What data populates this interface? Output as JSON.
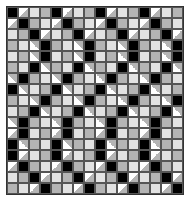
{
  "grid": {
    "columns": 16,
    "rows": 17,
    "cell_size_px": 11,
    "repeat_columns": 4,
    "colors": {
      "black": "#000000",
      "light": "#e2e2e2",
      "gray": "#b4b4b4",
      "white": "#ffffff",
      "border": "#555555"
    },
    "legend": {
      "B": "black square",
      "L": "light gray square",
      "G": "mid gray square",
      "TB": "half-square triangle (white/gray, diagonal /)",
      "TF": "half-square triangle (white/gray, diagonal \\)"
    },
    "unit_rows": [
      [
        "B",
        "TF",
        "L",
        "G"
      ],
      [
        "TF",
        "B",
        "G",
        "L"
      ],
      [
        "L",
        "G",
        "B",
        "TF"
      ],
      [
        "G",
        "L",
        "TB",
        "B"
      ],
      [
        "L",
        "G",
        "TB",
        "B"
      ],
      [
        "G",
        "L",
        "B",
        "TB"
      ],
      [
        "TB",
        "B",
        "G",
        "L"
      ],
      [
        "B",
        "TB",
        "L",
        "G"
      ],
      [
        "G",
        "L",
        "TB",
        "B"
      ],
      [
        "L",
        "G",
        "B",
        "TB"
      ],
      [
        "TB",
        "B",
        "G",
        "L"
      ],
      [
        "TF",
        "B",
        "L",
        "G"
      ],
      [
        "B",
        "TB",
        "G",
        "L"
      ],
      [
        "B",
        "TF",
        "L",
        "G"
      ],
      [
        "TF",
        "B",
        "G",
        "L"
      ],
      [
        "L",
        "G",
        "B",
        "TF"
      ],
      [
        "G",
        "L",
        "TF",
        "B"
      ]
    ]
  }
}
